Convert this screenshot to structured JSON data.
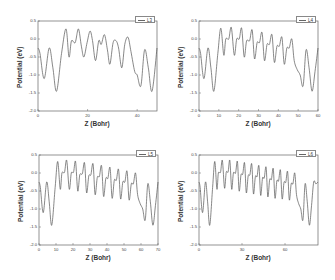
{
  "chart_data": [
    {
      "type": "line",
      "panel": "top-left",
      "legend": [
        "L3"
      ],
      "xlabel": "Z (Bohr)",
      "ylabel": "Potential (eV)",
      "xlim": [
        0,
        48
      ],
      "ylim": [
        -2.0,
        0.5
      ],
      "xticks": [
        0,
        20,
        40
      ],
      "yticks": [
        0.5,
        0.0,
        -0.5,
        -1.0,
        -1.5,
        -2.0
      ],
      "ytick_labels": [
        "0.5",
        "0.0",
        "-0.5",
        "-1.0",
        "-1.5",
        "-2.0"
      ],
      "series": [
        {
          "name": "L3",
          "x": [
            0,
            0.8,
            2.5,
            4.5,
            6.0,
            7.5,
            9.5,
            11.3,
            12.5,
            13.5,
            15.0,
            16.3,
            17.5,
            18.5,
            19.8,
            21.0,
            22.0,
            23.2,
            24.5,
            25.5,
            26.8,
            28.0,
            29.0,
            30.3,
            31.5,
            32.5,
            33.8,
            35.0,
            36.3,
            37.5,
            39.0,
            40.0,
            41.5,
            43.0,
            44.5,
            46.0,
            48.0
          ],
          "y": [
            -0.25,
            -0.4,
            -1.1,
            -0.25,
            -0.8,
            -1.45,
            -0.4,
            0.28,
            -0.5,
            -0.05,
            -0.1,
            0.28,
            -0.2,
            -0.5,
            -0.1,
            0.22,
            -0.05,
            -0.6,
            -0.05,
            -0.15,
            0.12,
            -0.3,
            -0.7,
            -0.1,
            -0.05,
            -0.25,
            -0.8,
            -0.15,
            0.05,
            -0.35,
            -0.9,
            -1.0,
            -1.3,
            -0.3,
            -0.8,
            -1.45,
            -0.25
          ]
        }
      ]
    },
    {
      "type": "line",
      "panel": "top-right",
      "legend": [
        "L4"
      ],
      "xlabel": "Z (Bohr)",
      "ylabel": "Potential (eV)",
      "xlim": [
        0,
        60
      ],
      "ylim": [
        -2.0,
        0.5
      ],
      "xticks": [
        0,
        10,
        20,
        30,
        40,
        50,
        60
      ],
      "yticks": [
        0.5,
        0.0,
        -0.5,
        -1.0,
        -1.5,
        -2.0
      ],
      "ytick_labels": [
        "0.5",
        "0.0",
        "-0.5",
        "-1.0",
        "-1.5",
        "-2.0"
      ],
      "series": [
        {
          "name": "L4",
          "x": [
            0,
            0.8,
            2.5,
            4.5,
            6.0,
            7.5,
            9.5,
            11.0,
            12.5,
            13.5,
            15.0,
            16.3,
            17.8,
            19.0,
            20.3,
            21.5,
            22.8,
            24.0,
            25.5,
            26.8,
            28.0,
            29.3,
            30.5,
            31.8,
            33.0,
            34.3,
            35.5,
            36.8,
            38.0,
            39.3,
            40.5,
            41.8,
            43.0,
            44.3,
            45.5,
            46.8,
            48.0,
            49.5,
            51.0,
            52.5,
            54.0,
            55.5,
            57.0,
            58.5,
            60.0
          ],
          "y": [
            -0.25,
            -0.4,
            -1.1,
            -0.25,
            -0.8,
            -1.45,
            -0.4,
            0.3,
            -0.45,
            0.0,
            0.0,
            0.32,
            -0.45,
            0.0,
            0.0,
            0.3,
            -0.5,
            -0.05,
            -0.05,
            0.25,
            -0.55,
            -0.1,
            -0.1,
            0.18,
            -0.6,
            -0.15,
            -0.15,
            0.12,
            -0.65,
            -0.2,
            -0.2,
            0.05,
            -0.7,
            -0.25,
            -0.25,
            0.0,
            -0.6,
            -0.85,
            -1.0,
            -1.3,
            -0.3,
            -0.8,
            -1.45,
            -0.9,
            -0.25
          ]
        }
      ]
    },
    {
      "type": "line",
      "panel": "bottom-left",
      "legend": [
        "L5"
      ],
      "xlabel": "Z (Bohr)",
      "ylabel": "Potential (eV)",
      "xlim": [
        0,
        70
      ],
      "ylim": [
        -2.0,
        0.5
      ],
      "xticks": [
        0,
        10,
        20,
        30,
        40,
        50,
        60,
        70
      ],
      "yticks": [
        0.5,
        0.0,
        -0.5,
        -1.0,
        -1.5,
        -2.0
      ],
      "ytick_labels": [
        "0.5",
        "0.0",
        "-0.5",
        "-1.0",
        "-1.5",
        "-2.0"
      ],
      "series": [
        {
          "name": "L5",
          "x": [
            0,
            0.8,
            2.5,
            4.5,
            6.0,
            7.5,
            9.5,
            11.0,
            12.5,
            13.5,
            15.0,
            16.3,
            17.8,
            19.0,
            20.3,
            21.5,
            22.8,
            24.0,
            25.5,
            26.8,
            28.0,
            29.3,
            30.5,
            31.8,
            33.0,
            34.3,
            35.5,
            36.8,
            38.0,
            39.3,
            40.5,
            41.8,
            43.0,
            44.3,
            45.5,
            46.8,
            48.0,
            49.3,
            50.5,
            51.8,
            53.0,
            54.3,
            55.5,
            56.8,
            58.0,
            59.5,
            61.0,
            62.5,
            64.0,
            65.5,
            67.0,
            68.5,
            70.0
          ],
          "y": [
            -0.25,
            -0.4,
            -1.1,
            -0.25,
            -0.8,
            -1.45,
            -0.4,
            0.32,
            -0.45,
            0.0,
            0.02,
            0.35,
            -0.45,
            0.0,
            0.02,
            0.32,
            -0.5,
            -0.05,
            -0.02,
            0.28,
            -0.55,
            -0.08,
            -0.05,
            0.25,
            -0.6,
            -0.12,
            -0.1,
            0.2,
            -0.65,
            -0.15,
            -0.15,
            0.15,
            -0.7,
            -0.2,
            -0.2,
            0.1,
            -0.72,
            -0.25,
            -0.25,
            0.05,
            -0.75,
            -0.3,
            -0.3,
            0.0,
            -0.6,
            -0.85,
            -1.0,
            -1.3,
            -0.3,
            -0.8,
            -1.45,
            -0.9,
            -0.25
          ]
        }
      ]
    },
    {
      "type": "line",
      "panel": "bottom-right",
      "legend": [
        "L6"
      ],
      "xlabel": "Z (Bohr)",
      "ylabel": "Potential (eV)",
      "xlim": [
        0,
        83
      ],
      "ylim": [
        -2.0,
        0.5
      ],
      "xticks": [
        0,
        30,
        60
      ],
      "yticks": [
        0.5,
        0.0,
        -0.5,
        -1.0,
        -1.5,
        -2.0
      ],
      "ytick_labels": [
        "0.5",
        "0.0",
        "-0.5",
        "-1.0",
        "-1.5",
        "-2.0"
      ],
      "series": [
        {
          "name": "L6",
          "x": [
            0,
            0.8,
            2.5,
            4.5,
            6.0,
            7.5,
            9.5,
            11.0,
            12.5,
            13.5,
            15.0,
            16.3,
            17.8,
            19.0,
            20.3,
            21.5,
            22.8,
            24.0,
            25.5,
            26.8,
            28.0,
            29.3,
            30.5,
            31.8,
            33.0,
            34.3,
            35.5,
            36.8,
            38.0,
            39.3,
            40.5,
            41.8,
            43.0,
            44.3,
            45.5,
            46.8,
            48.0,
            49.3,
            50.5,
            51.8,
            53.0,
            54.3,
            55.5,
            56.8,
            58.0,
            59.3,
            60.5,
            61.8,
            63.0,
            64.3,
            65.5,
            66.8,
            68.0,
            69.5,
            71.0,
            72.5,
            74.0,
            75.5,
            77.0,
            78.5,
            80.0,
            81.5,
            83.0
          ],
          "y": [
            -0.25,
            -0.4,
            -1.1,
            -0.25,
            -0.8,
            -1.45,
            -0.4,
            0.32,
            -0.45,
            0.0,
            0.02,
            0.35,
            -0.42,
            0.02,
            0.03,
            0.35,
            -0.45,
            0.0,
            0.0,
            0.32,
            -0.5,
            -0.05,
            -0.03,
            0.28,
            -0.55,
            -0.08,
            -0.05,
            0.25,
            -0.58,
            -0.1,
            -0.1,
            0.2,
            -0.62,
            -0.14,
            -0.14,
            0.16,
            -0.66,
            -0.18,
            -0.18,
            0.12,
            -0.7,
            -0.22,
            -0.22,
            0.08,
            -0.72,
            -0.26,
            -0.26,
            0.04,
            -0.75,
            -0.3,
            -0.3,
            0.0,
            -0.6,
            -0.85,
            -1.0,
            -1.3,
            -0.3,
            -0.8,
            -1.45,
            -0.9,
            -0.25,
            -0.3,
            -0.25
          ]
        }
      ]
    }
  ],
  "panels": [
    {
      "id": "p0",
      "left": 0,
      "top": 0,
      "frame": {
        "x": 38,
        "y": 21,
        "w": 119,
        "h": 90
      }
    },
    {
      "id": "p1",
      "left": 168,
      "top": 0,
      "frame": {
        "x": 31,
        "y": 21,
        "w": 119,
        "h": 90
      }
    },
    {
      "id": "p2",
      "left": 0,
      "top": 140,
      "frame": {
        "x": 39,
        "y": 15,
        "w": 119,
        "h": 90
      }
    },
    {
      "id": "p3",
      "left": 168,
      "top": 140,
      "frame": {
        "x": 31,
        "y": 15,
        "w": 119,
        "h": 90
      }
    }
  ],
  "style": {
    "line_color": "#555555",
    "frame_color": "#666666"
  }
}
